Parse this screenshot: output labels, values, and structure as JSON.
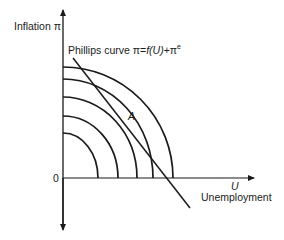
{
  "diagram": {
    "y_axis_label": "Inflation π",
    "x_axis_symbol": "U",
    "x_axis_label": "Unemployment",
    "origin_label": "0",
    "phillips_label_prefix": "Phillips curve π=",
    "phillips_label_formula": "f(U)",
    "phillips_label_suffix": "+π",
    "phillips_label_sup": "e",
    "point_label": "A",
    "indifference_curves_count": 5,
    "colors": {
      "line": "#1a1a1a",
      "background": "#ffffff"
    }
  }
}
